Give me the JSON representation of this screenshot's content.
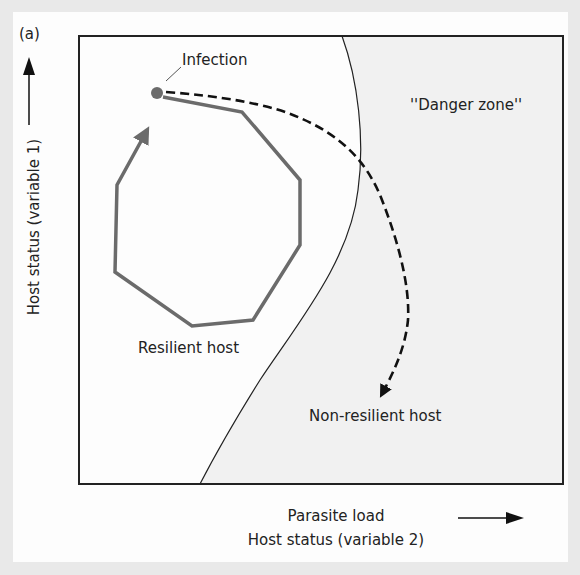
{
  "panel_label": "(a)",
  "axes": {
    "y_label": "Host status (variable 1)",
    "x_label_line1": "Parasite load",
    "x_label_line2": "Host status (variable 2)"
  },
  "regions": {
    "danger_zone_label": "''Danger zone''"
  },
  "annotations": {
    "infection": "Infection",
    "resilient_host": "Resilient host",
    "non_resilient_host": "Non-resilient host"
  },
  "colors": {
    "background": "#e9e9e9",
    "card": "#fdfdfd",
    "danger_zone_fill": "#f1f1f1",
    "frame": "#222222",
    "resilient_path": "#6b6b6b",
    "nonresilient_path": "#111111",
    "infection_dot": "#6b6b6b"
  }
}
